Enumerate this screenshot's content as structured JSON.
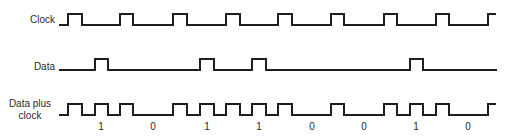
{
  "diagram": {
    "type": "timing-diagram",
    "signals": [
      {
        "name": "clock",
        "label": "Clock"
      },
      {
        "name": "data",
        "label": "Data"
      },
      {
        "name": "data-plus-clock",
        "label_line1": "Data plus",
        "label_line2": "clock"
      }
    ],
    "bits": [
      "1",
      "0",
      "1",
      "1",
      "0",
      "0",
      "1",
      "0"
    ],
    "colors": {
      "line": "#1e1e1e",
      "text": "#2a2a2a",
      "background": "#ffffff"
    }
  }
}
